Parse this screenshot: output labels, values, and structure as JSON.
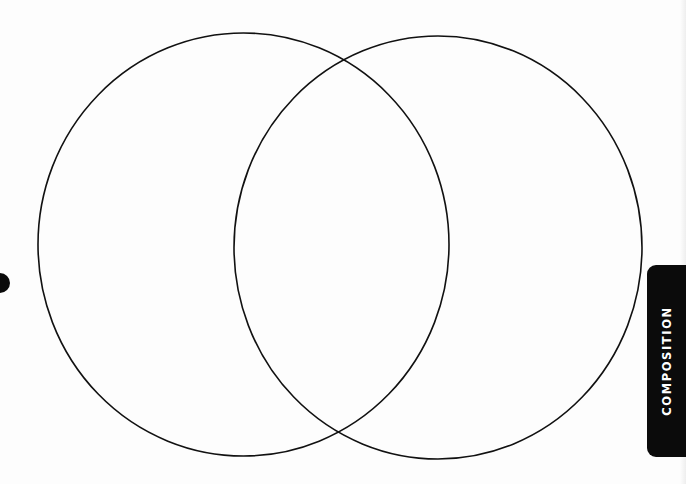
{
  "diagram": {
    "type": "venn",
    "sets": [
      {
        "name": "left-circle",
        "label": ""
      },
      {
        "name": "right-circle",
        "label": ""
      }
    ],
    "overlap_label": "",
    "stroke_color": "#111111",
    "background_color": "#fdfdfd"
  },
  "section_tab": {
    "label": "COMPOSITION",
    "background_color": "#0b0b0b",
    "text_color": "#ffffff"
  },
  "margin_marker": {
    "icon": "filled-circle-icon",
    "color": "#0a0a0a"
  }
}
